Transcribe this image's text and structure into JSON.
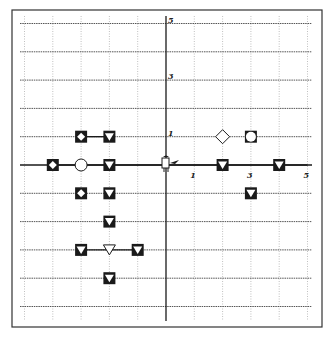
{
  "diagram": {
    "type": "grid-board",
    "frame": {
      "x": 12,
      "y": 10,
      "width": 310,
      "height": 317
    },
    "origin_px": {
      "x": 166,
      "y": 165
    },
    "unit_px": 28.3,
    "grid_range": {
      "x": [
        -5,
        5
      ],
      "y": [
        -5,
        5
      ]
    },
    "axis_labels": {
      "y": [
        {
          "text": "5",
          "value": 5
        },
        {
          "text": "3",
          "value": 3
        },
        {
          "text": "1",
          "value": 1
        }
      ],
      "x": [
        {
          "text": "1",
          "value": 1
        },
        {
          "text": "3",
          "value": 3
        },
        {
          "text": "5",
          "value": 5
        }
      ]
    },
    "connector_lines": [
      {
        "y": 1,
        "x_from": -3,
        "x_to": -2
      },
      {
        "y": 0,
        "x_from": -4,
        "x_to": 5
      },
      {
        "y": -3,
        "x_from": -3,
        "x_to": -1
      }
    ],
    "markers": [
      {
        "x": -3,
        "y": 1,
        "kind": "filled-square-diamond"
      },
      {
        "x": -2,
        "y": 1,
        "kind": "filled-square-triangle"
      },
      {
        "x": 2,
        "y": 1,
        "kind": "hollow-diamond"
      },
      {
        "x": 3,
        "y": 1,
        "kind": "square-hollow-circle"
      },
      {
        "x": -4,
        "y": 0,
        "kind": "filled-square-diamond"
      },
      {
        "x": -3,
        "y": 0,
        "kind": "hollow-circle"
      },
      {
        "x": -2,
        "y": 0,
        "kind": "filled-square-triangle"
      },
      {
        "x": 2,
        "y": 0,
        "kind": "filled-square-triangle"
      },
      {
        "x": 4,
        "y": 0,
        "kind": "filled-square-triangle"
      },
      {
        "x": -3,
        "y": -1,
        "kind": "filled-square-diamond"
      },
      {
        "x": -2,
        "y": -1,
        "kind": "filled-square-triangle"
      },
      {
        "x": 3,
        "y": -1,
        "kind": "filled-square-triangle"
      },
      {
        "x": -2,
        "y": -2,
        "kind": "filled-square-triangle"
      },
      {
        "x": -3,
        "y": -3,
        "kind": "filled-square-triangle"
      },
      {
        "x": -2,
        "y": -3,
        "kind": "hollow-triangle"
      },
      {
        "x": -1,
        "y": -3,
        "kind": "filled-square-triangle"
      },
      {
        "x": -2,
        "y": -4,
        "kind": "filled-square-triangle"
      }
    ],
    "agent": {
      "x": 0,
      "y": 0,
      "icon": "robot-figure-icon",
      "facing": "right"
    },
    "colors": {
      "ink": "#1a1a1a",
      "grid": "#8a8a8a",
      "background": "#ffffff"
    }
  }
}
